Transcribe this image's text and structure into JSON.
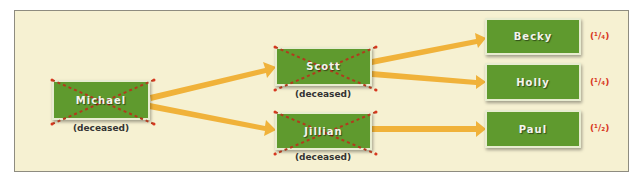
{
  "diagram": {
    "type": "inheritance-flow",
    "colors": {
      "panel_bg": "#f6f1d2",
      "node_fill": "#5f9a2e",
      "arrow": "#f0b23a",
      "cross": "#b23a1d",
      "fraction": "#d8371f"
    },
    "nodes": [
      {
        "id": "michael",
        "label": "Michael",
        "status": "(deceased)",
        "deceased": true
      },
      {
        "id": "scott",
        "label": "Scott",
        "status": "(deceased)",
        "deceased": true
      },
      {
        "id": "jillian",
        "label": "Jillian",
        "status": "(deceased)",
        "deceased": true
      },
      {
        "id": "becky",
        "label": "Becky",
        "share": "(¹/₄)"
      },
      {
        "id": "holly",
        "label": "Holly",
        "share": "(¹/₄)"
      },
      {
        "id": "paul",
        "label": "Paul",
        "share": "(¹/₂)"
      }
    ],
    "edges": [
      {
        "from": "Michael",
        "to": "Scott"
      },
      {
        "from": "Michael",
        "to": "Jillian"
      },
      {
        "from": "Scott",
        "to": "Becky"
      },
      {
        "from": "Scott",
        "to": "Holly"
      },
      {
        "from": "Jillian",
        "to": "Paul"
      }
    ]
  }
}
